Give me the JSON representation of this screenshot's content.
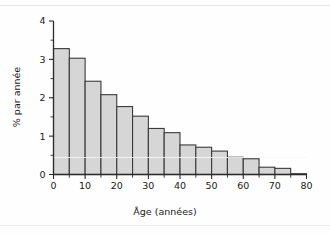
{
  "chart_data": {
    "type": "bar",
    "title": "",
    "subtitle": "",
    "xlabel": "Âge (années)",
    "ylabel": "% par année",
    "xlim": [
      0,
      80
    ],
    "ylim": [
      0,
      4
    ],
    "grid": false,
    "legend": null,
    "bin_width": 5,
    "x_ticks": [
      0,
      10,
      20,
      30,
      40,
      50,
      60,
      70,
      80
    ],
    "x_tick_labels": [
      "0",
      "10",
      "20",
      "30",
      "40",
      "50",
      "60",
      "70",
      "80"
    ],
    "x_minor_ticks": [
      5,
      15,
      25,
      35,
      45,
      55,
      65,
      75
    ],
    "y_ticks": [
      0,
      1,
      2,
      3,
      4
    ],
    "y_tick_labels": [
      "0",
      "1",
      "2",
      "3",
      "4"
    ],
    "categories": [
      "0-5",
      "5-10",
      "10-15",
      "15-20",
      "20-25",
      "25-30",
      "30-35",
      "35-40",
      "40-45",
      "45-50",
      "50-55",
      "55-60",
      "60-65",
      "65-70",
      "70-75",
      "75-80"
    ],
    "bin_starts": [
      0,
      5,
      10,
      15,
      20,
      25,
      30,
      35,
      40,
      45,
      50,
      55,
      60,
      65,
      70,
      75
    ],
    "values": [
      3.28,
      3.03,
      2.43,
      2.08,
      1.77,
      1.52,
      1.2,
      1.09,
      0.77,
      0.71,
      0.61,
      0.45,
      0.41,
      0.19,
      0.16,
      0.02
    ],
    "bar_fill_color": "#d6d6d6",
    "bar_border_color": "#3a3a3a",
    "axis_color": "#2b2b2b"
  }
}
